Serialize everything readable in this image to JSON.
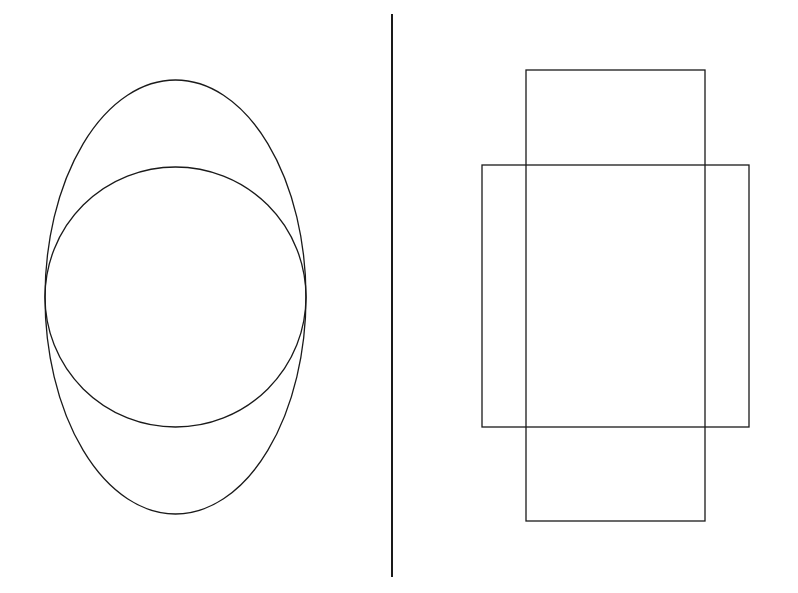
{
  "diagram": {
    "background": "#ffffff",
    "stroke_color": "#1a1a1a",
    "panels": [
      {
        "name": "left-panel",
        "shapes": [
          {
            "type": "ellipse",
            "name": "tall-ellipse",
            "cx": 175.5,
            "cy": 297,
            "rx": 130.5,
            "ry": 217
          },
          {
            "type": "circle",
            "name": "inner-circle",
            "cx": 175.5,
            "cy": 297,
            "rx": 130.5,
            "ry": 130
          }
        ]
      },
      {
        "name": "right-panel",
        "shapes": [
          {
            "type": "rect",
            "name": "tall-rectangle",
            "x": 526,
            "y": 70,
            "w": 179,
            "h": 451
          },
          {
            "type": "rect",
            "name": "wide-rectangle",
            "x": 482,
            "y": 165,
            "w": 267,
            "h": 262
          }
        ]
      }
    ],
    "divider": {
      "x": 392,
      "y1": 14,
      "y2": 577,
      "width": 2
    }
  }
}
